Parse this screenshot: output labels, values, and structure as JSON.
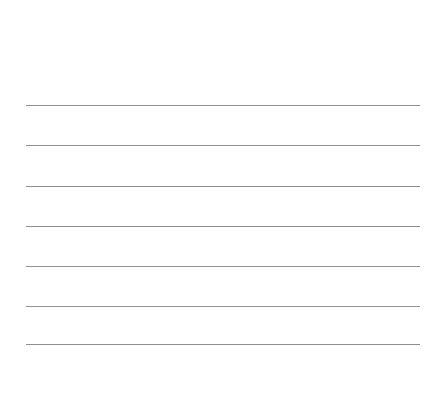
{
  "page": {
    "width": 446,
    "height": 412,
    "background_color": "#ffffff",
    "kind": "ruled-paper-sheet",
    "title": ""
  },
  "ruling": {
    "line_color": "#8f8f8f",
    "line_thickness_px": 1,
    "line_count": 7,
    "line_spacing_px": 40,
    "left_margin_px": 26,
    "right_margin_px": 26,
    "line_left_x": 26,
    "line_right_x": 420,
    "line_width_px": 394,
    "top_margin_px": 105,
    "bottom_margin_px": 67,
    "lines": [
      {
        "index": 1,
        "y": 105,
        "x": 26,
        "width": 394,
        "color": "#8f8f8f",
        "text": ""
      },
      {
        "index": 2,
        "y": 145,
        "x": 26,
        "width": 394,
        "color": "#8f8f8f",
        "text": ""
      },
      {
        "index": 3,
        "y": 186,
        "x": 26,
        "width": 394,
        "color": "#8f8f8f",
        "text": ""
      },
      {
        "index": 4,
        "y": 226,
        "x": 26,
        "width": 394,
        "color": "#8f8f8f",
        "text": ""
      },
      {
        "index": 5,
        "y": 266,
        "x": 26,
        "width": 394,
        "color": "#929292",
        "text": ""
      },
      {
        "index": 6,
        "y": 306,
        "x": 26,
        "width": 394,
        "color": "#949494",
        "text": ""
      },
      {
        "index": 7,
        "y": 344,
        "x": 26,
        "width": 394,
        "color": "#8f8f8f",
        "text": ""
      }
    ]
  }
}
